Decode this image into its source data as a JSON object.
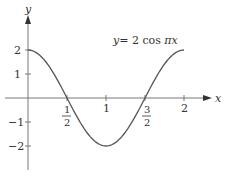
{
  "chart_data": {
    "type": "line",
    "title": "",
    "annotation": "y = 2 cos πx",
    "annotation_parts": {
      "y": "y",
      "eq": "= 2 cos ",
      "pi": "π",
      "x": "x"
    },
    "xlabel": "x",
    "ylabel": "y",
    "xlim": [
      0,
      2
    ],
    "ylim": [
      -2,
      2
    ],
    "grid": false,
    "legend": "none",
    "x_ticks": [
      {
        "value": 0.5,
        "num": "1",
        "den": "2"
      },
      {
        "value": 1,
        "label": "1"
      },
      {
        "value": 1.5,
        "num": "3",
        "den": "2"
      },
      {
        "value": 2,
        "label": "2"
      }
    ],
    "y_ticks": [
      {
        "value": 2,
        "label": "2"
      },
      {
        "value": 1,
        "label": "1"
      },
      {
        "value": -1,
        "label": "−1"
      },
      {
        "value": -2,
        "label": "−2"
      }
    ],
    "series": [
      {
        "name": "y = 2 cos πx",
        "function": "2*cos(pi*x)",
        "x": [
          0,
          0.25,
          0.5,
          0.75,
          1,
          1.25,
          1.5,
          1.75,
          2
        ],
        "values": [
          2,
          1.414,
          0,
          -1.414,
          -2,
          -1.414,
          0,
          1.414,
          2
        ]
      }
    ],
    "colors": {
      "curve": "#555555",
      "axis": "#777777",
      "text": "#333333"
    }
  }
}
